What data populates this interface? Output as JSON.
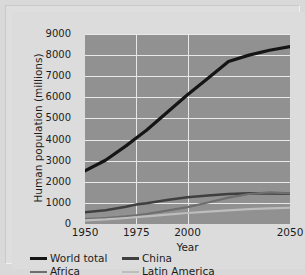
{
  "chart_data": {
    "type": "line",
    "title": "",
    "xlabel": "Year",
    "ylabel": "Human population (millions)",
    "xlim": [
      1950,
      2050
    ],
    "ylim": [
      0,
      9000
    ],
    "xticks": [
      1950,
      1975,
      2000,
      2050
    ],
    "yticks": [
      0,
      1000,
      2000,
      3000,
      4000,
      5000,
      6000,
      7000,
      8000,
      9000
    ],
    "grid": "horizontal-and-vertical",
    "legend_position": "below-axes",
    "plot_background": "#919191",
    "gridline_color": "#e8e8e8",
    "x": [
      1950,
      1960,
      1970,
      1975,
      1980,
      1990,
      2000,
      2010,
      2020,
      2030,
      2040,
      2050
    ],
    "series": [
      {
        "name": "World total",
        "color": "#151515",
        "width": 3.2,
        "values": [
          2520,
          3020,
          3700,
          4070,
          4440,
          5280,
          6120,
          6900,
          7700,
          8000,
          8230,
          8400
        ]
      },
      {
        "name": "China",
        "color": "#3f3f3f",
        "width": 2.6,
        "values": [
          555,
          650,
          820,
          920,
          985,
          1140,
          1270,
          1350,
          1420,
          1450,
          1450,
          1430
        ]
      },
      {
        "name": "Africa",
        "color": "#6e6e6e",
        "width": 2.2,
        "values": [
          230,
          285,
          360,
          410,
          475,
          630,
          800,
          1020,
          1250,
          1420,
          1500,
          1450
        ]
      },
      {
        "name": "Latin America",
        "color": "#bdbdbd",
        "width": 2.2,
        "values": [
          167,
          215,
          285,
          322,
          360,
          440,
          520,
          590,
          650,
          700,
          740,
          770
        ]
      }
    ]
  },
  "axis": {
    "ylabel": "Human population (millions)",
    "xlabel": "Year",
    "yticks": [
      "9000",
      "8000",
      "7000",
      "6000",
      "5000",
      "4000",
      "3000",
      "2000",
      "1000",
      "0"
    ],
    "xticks": [
      "1950",
      "1975",
      "2000",
      "2050"
    ]
  },
  "legend": {
    "entries": [
      {
        "label": "World total",
        "color": "#151515"
      },
      {
        "label": "China",
        "color": "#3f3f3f"
      },
      {
        "label": "Africa",
        "color": "#6e6e6e"
      },
      {
        "label": "Latin America",
        "color": "#bdbdbd"
      }
    ]
  }
}
